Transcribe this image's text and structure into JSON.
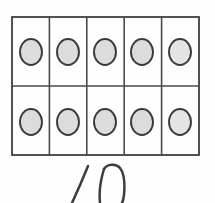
{
  "worksheet": {
    "title": "Ten frame with counters and handwritten number",
    "background_color": "#fefefe",
    "grid": {
      "columns": 5,
      "rows": 2,
      "x": 12,
      "y": 17,
      "width": 187,
      "height": 138,
      "line_color": "#4a4a4a",
      "frame_color": "#3f3f3f"
    },
    "counters": {
      "total": 10,
      "fill_color": "#dcdcdc",
      "outline_color": "#3a3a3a",
      "radius_x": 11,
      "radius_y": 13,
      "cells": [
        {
          "row": 1,
          "col": 1,
          "cx": 31,
          "cy": 52,
          "filled": true
        },
        {
          "row": 1,
          "col": 2,
          "cx": 68,
          "cy": 52,
          "filled": true
        },
        {
          "row": 1,
          "col": 3,
          "cx": 105,
          "cy": 52,
          "filled": true
        },
        {
          "row": 1,
          "col": 4,
          "cx": 142,
          "cy": 52,
          "filled": true
        },
        {
          "row": 1,
          "col": 5,
          "cx": 180,
          "cy": 52,
          "filled": true
        },
        {
          "row": 2,
          "col": 1,
          "cx": 31,
          "cy": 122,
          "filled": true
        },
        {
          "row": 2,
          "col": 2,
          "cx": 68,
          "cy": 122,
          "filled": true
        },
        {
          "row": 2,
          "col": 3,
          "cx": 105,
          "cy": 122,
          "filled": true
        },
        {
          "row": 2,
          "col": 4,
          "cx": 142,
          "cy": 122,
          "filled": true
        },
        {
          "row": 2,
          "col": 5,
          "cx": 180,
          "cy": 122,
          "filled": true
        }
      ]
    },
    "answer": {
      "value": "10",
      "style": "handwritten",
      "ink_color": "#3c3c44",
      "clipped_at_bottom": true
    }
  }
}
